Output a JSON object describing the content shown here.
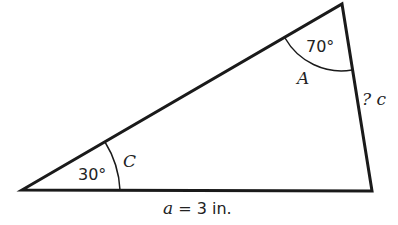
{
  "diagram": {
    "type": "triangle",
    "angle_A": {
      "name": "A",
      "value": "70°"
    },
    "angle_C": {
      "name": "C",
      "value": "30°"
    },
    "side_c": {
      "label": "? c"
    },
    "side_a": {
      "var": "a",
      "rest": " = 3 in."
    }
  }
}
